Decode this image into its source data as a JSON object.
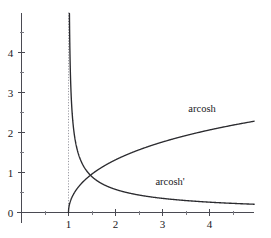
{
  "chart_data": {
    "type": "line",
    "title": "",
    "subtitle": "",
    "xlabel": "",
    "ylabel": "",
    "xlim": [
      -0.1,
      4.95
    ],
    "ylim": [
      -0.25,
      5.0
    ],
    "grid": false,
    "legend_position": "inline-labels",
    "x_ticks_major": [
      1,
      2,
      3,
      4
    ],
    "x_ticks_major_labels": [
      "1",
      "2",
      "3",
      "4"
    ],
    "x_ticks_minor": [
      0.5,
      1.5,
      2.5,
      3.5,
      4.5
    ],
    "y_ticks_major": [
      0,
      1,
      2,
      3,
      4
    ],
    "y_ticks_major_labels": [
      "0",
      "1",
      "2",
      "3",
      "4"
    ],
    "y_ticks_minor": [
      0.5,
      1.5,
      2.5,
      3.5,
      4.5
    ],
    "annotations": [
      {
        "text": "arcosh",
        "x": 3.55,
        "y": 2.52
      },
      {
        "text": "arcosh'",
        "x": 2.85,
        "y": 0.7
      }
    ],
    "asymptotes": [
      {
        "orientation": "vertical",
        "x": 1,
        "style": "dotted",
        "color": "#9a9aa2"
      }
    ],
    "series": [
      {
        "name": "arcosh",
        "label": "arcosh",
        "color": "#2b2b2f",
        "style": "solid",
        "x": [
          1.0,
          1.02,
          1.05,
          1.1,
          1.15,
          1.2,
          1.3,
          1.4,
          1.5,
          1.6,
          1.75,
          1.9,
          2.0,
          2.25,
          2.5,
          2.75,
          3.0,
          3.25,
          3.5,
          3.75,
          4.0,
          4.25,
          4.5,
          4.75,
          4.95
        ],
        "y": [
          0.0,
          0.2,
          0.316,
          0.444,
          0.542,
          0.622,
          0.756,
          0.867,
          0.962,
          1.047,
          1.162,
          1.262,
          1.317,
          1.445,
          1.567,
          1.663,
          1.763,
          1.851,
          1.931,
          2.004,
          2.063,
          2.122,
          2.185,
          2.238,
          2.282
        ]
      },
      {
        "name": "arcosh_prime",
        "label": "arcosh'",
        "color": "#2b2b2f",
        "style": "solid",
        "formula": "1/sqrt(x^2-1)",
        "x": [
          1.005,
          1.01,
          1.02,
          1.04,
          1.07,
          1.1,
          1.15,
          1.2,
          1.3,
          1.4,
          1.5,
          1.6,
          1.8,
          2.0,
          2.25,
          2.5,
          2.75,
          3.0,
          3.5,
          4.0,
          4.5,
          4.95
        ],
        "y": [
          9.99,
          7.06,
          4.99,
          3.54,
          2.62,
          2.18,
          1.79,
          1.51,
          1.31,
          1.02,
          0.894,
          0.8,
          0.671,
          0.577,
          0.495,
          0.436,
          0.39,
          0.354,
          0.299,
          0.258,
          0.228,
          0.206
        ]
      }
    ]
  },
  "figure": {
    "background_color": "#ffffff",
    "axis_color": "#4a4a52",
    "curve_color": "#2b2b2f",
    "asymptote_color": "#9a9aa2",
    "origin_px": {
      "x": 21.5,
      "y": 212.5
    },
    "unit_px": {
      "x": 47.0,
      "y": 40.0
    }
  }
}
